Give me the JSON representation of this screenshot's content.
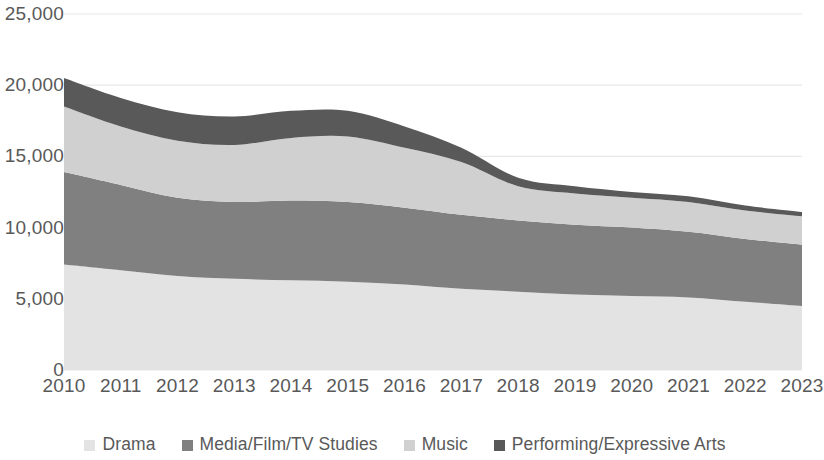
{
  "chart_data": {
    "type": "area",
    "stacked": true,
    "title": "",
    "subtitle": "",
    "xlabel": "",
    "ylabel": "",
    "grid": true,
    "legend_position": "bottom",
    "xlim": [
      2010,
      2023
    ],
    "ylim": [
      0,
      25000
    ],
    "ytick_values": [
      0,
      5000,
      10000,
      15000,
      20000,
      25000
    ],
    "ytick_labels": [
      "0",
      "5,000",
      "10,000",
      "15,000",
      "20,000",
      "25,000"
    ],
    "categories": [
      2010,
      2011,
      2012,
      2013,
      2014,
      2015,
      2016,
      2017,
      2018,
      2019,
      2020,
      2021,
      2022,
      2023
    ],
    "xtick_labels": [
      "2010",
      "2011",
      "2012",
      "2013",
      "2014",
      "2015",
      "2016",
      "2017",
      "2018",
      "2019",
      "2020",
      "2021",
      "2022",
      "2023"
    ],
    "series": [
      {
        "name": "Drama",
        "color": "#e3e3e3",
        "values": [
          7400,
          7000,
          6600,
          6400,
          6300,
          6200,
          6000,
          5700,
          5500,
          5300,
          5200,
          5100,
          4800,
          4500
        ]
      },
      {
        "name": "Media/Film/TV Studies",
        "color": "#808080",
        "values": [
          6500,
          6000,
          5500,
          5400,
          5600,
          5600,
          5400,
          5200,
          5000,
          4900,
          4800,
          4600,
          4400,
          4300
        ]
      },
      {
        "name": "Music",
        "color": "#d0d0d0",
        "values": [
          4600,
          4100,
          4000,
          4000,
          4400,
          4600,
          4200,
          3700,
          2400,
          2200,
          2100,
          2100,
          2000,
          2000
        ]
      },
      {
        "name": "Performing/Expressive Arts",
        "color": "#595959",
        "values": [
          2000,
          2000,
          2000,
          2000,
          1900,
          1800,
          1500,
          1000,
          600,
          500,
          400,
          400,
          350,
          300
        ]
      }
    ],
    "totals": [
      20500,
      19100,
      18100,
      17800,
      18200,
      18200,
      17100,
      15600,
      13500,
      12900,
      12500,
      12200,
      11550,
      11100
    ]
  },
  "legend": {
    "items": [
      {
        "label": "Drama",
        "color": "#e3e3e3"
      },
      {
        "label": "Media/Film/TV Studies",
        "color": "#808080"
      },
      {
        "label": "Music",
        "color": "#d0d0d0"
      },
      {
        "label": "Performing/Expressive Arts",
        "color": "#595959"
      }
    ]
  },
  "axis": {
    "y_labels": [
      "25,000",
      "20,000",
      "15,000",
      "10,000",
      "5,000",
      "0"
    ],
    "x_labels": [
      "2010",
      "2011",
      "2012",
      "2013",
      "2014",
      "2015",
      "2016",
      "2017",
      "2018",
      "2019",
      "2020",
      "2021",
      "2022",
      "2023"
    ]
  },
  "style": {
    "gridline_color": "#e8e8e8",
    "text_color": "#595959",
    "background": "#ffffff"
  }
}
